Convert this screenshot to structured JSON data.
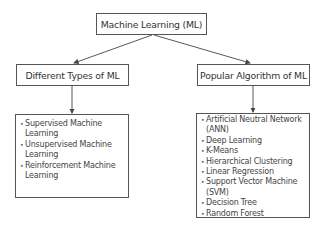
{
  "root": {
    "label": "Machine Learning (ML)"
  },
  "branches": [
    {
      "label": "Different Types of ML",
      "items": [
        "Supervised Machine Learning",
        "Unsupervised Machine Learning",
        "Reinforcement Machine Learning"
      ]
    },
    {
      "label": "Popular Algorithm of ML",
      "items": [
        "Artificial Neutral Network (ANN)",
        "Deep Learning",
        "K-Means",
        "Hierarchical Clustering",
        "Linear Regression",
        "Support Vector Machine (SVM)",
        "Decision Tree",
        "Random Forest"
      ]
    }
  ]
}
